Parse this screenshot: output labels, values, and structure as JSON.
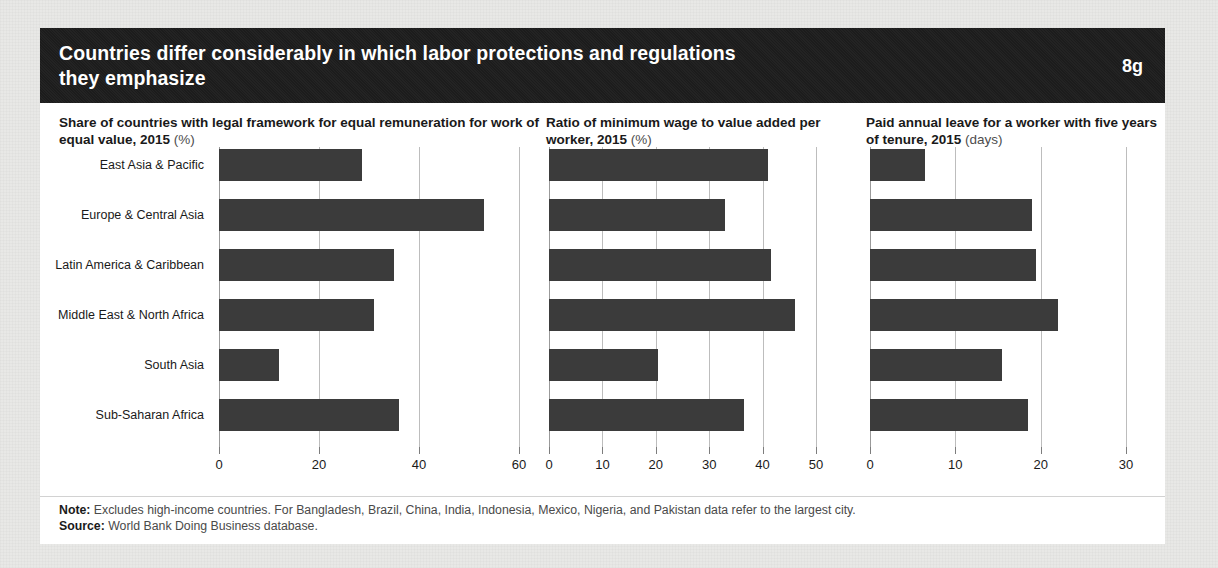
{
  "figure": {
    "title": "Countries differ considerably in which labor protections and regulations they emphasize",
    "badge": "8g",
    "note_label": "Note:",
    "note_text": " Excludes high-income countries. For Bangladesh, Brazil, China, India, Indonesia, Mexico, Nigeria, and Pakistan data refer to the largest city.",
    "source_label": "Source:",
    "source_text": " World Bank Doing Business database."
  },
  "chart_data": [
    {
      "type": "bar",
      "orientation": "horizontal",
      "title": "Share of countries with legal framework for equal remuneration for work of equal value, 2015",
      "title_main": "Share of countries with legal framework for equal remuneration for work of equal value, 2015",
      "unit": "(%)",
      "xlabel": "",
      "ylabel": "",
      "categories": [
        "East Asia & Pacific",
        "Europe & Central Asia",
        "Latin America & Caribbean",
        "Middle East & North Africa",
        "South Asia",
        "Sub-Saharan Africa"
      ],
      "values": [
        28.5,
        53,
        35,
        31,
        12,
        36
      ],
      "xlim": [
        0,
        60
      ],
      "xticks": [
        0,
        20,
        40,
        60
      ],
      "xticklabels": [
        "0",
        "20",
        "40",
        "60"
      ],
      "grid": true,
      "legend": false,
      "bar_color": "#3b3b3b"
    },
    {
      "type": "bar",
      "orientation": "horizontal",
      "title": "Ratio of minimum wage to value added per worker, 2015",
      "title_main": "Ratio of minimum wage to value added per worker, 2015",
      "unit": "(%)",
      "xlabel": "",
      "ylabel": "",
      "categories": [
        "East Asia & Pacific",
        "Europe & Central Asia",
        "Latin America & Caribbean",
        "Middle East & North Africa",
        "South Asia",
        "Sub-Saharan Africa"
      ],
      "values": [
        41,
        33,
        41.5,
        46,
        20.5,
        36.5
      ],
      "xlim": [
        0,
        50
      ],
      "xticks": [
        0,
        10,
        20,
        30,
        40,
        50
      ],
      "xticklabels": [
        "0",
        "10",
        "20",
        "30",
        "40",
        "50"
      ],
      "grid": true,
      "legend": false,
      "bar_color": "#3b3b3b"
    },
    {
      "type": "bar",
      "orientation": "horizontal",
      "title": "Paid annual leave for a worker with five years of tenure, 2015",
      "title_main": "Paid annual leave for a worker with five years of tenure, 2015",
      "unit": "(days)",
      "xlabel": "",
      "ylabel": "",
      "categories": [
        "East Asia & Pacific",
        "Europe & Central Asia",
        "Latin America & Caribbean",
        "Middle East & North Africa",
        "South Asia",
        "Sub-Saharan Africa"
      ],
      "values": [
        6.5,
        19,
        19.5,
        22,
        15.5,
        18.5
      ],
      "xlim": [
        0,
        30
      ],
      "xticks": [
        0,
        10,
        20,
        30
      ],
      "xticklabels": [
        "0",
        "10",
        "20",
        "30"
      ],
      "grid": true,
      "legend": false,
      "bar_color": "#3b3b3b"
    }
  ]
}
